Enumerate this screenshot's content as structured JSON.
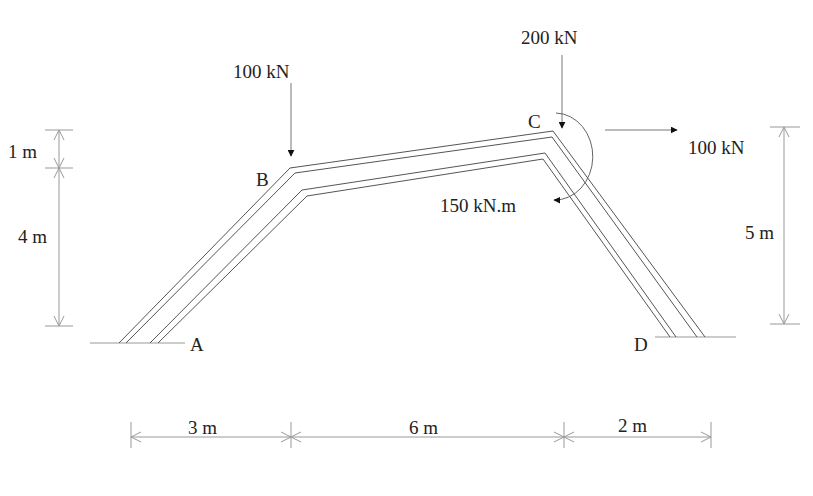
{
  "diagram": {
    "type": "structural frame",
    "nodes": {
      "A": "A",
      "B": "B",
      "C": "C",
      "D": "D"
    },
    "loads": {
      "load_b": "100 kN",
      "load_c_vertical": "200 kN",
      "load_c_horizontal": "100 kN",
      "moment_c": "150 kN.m"
    },
    "dimensions": {
      "left_upper": "1 m",
      "left_lower": "4 m",
      "right": "5 m",
      "bottom_1": "3 m",
      "bottom_2": "6 m",
      "bottom_3": "2 m"
    }
  }
}
